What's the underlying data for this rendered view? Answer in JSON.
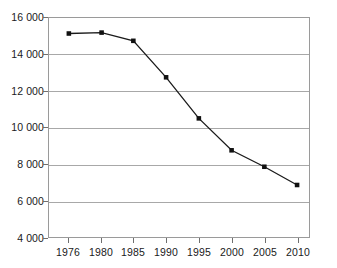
{
  "chart_data": {
    "type": "line",
    "title": "",
    "subtitle": "",
    "xlabel": "",
    "ylabel": "",
    "categories": [
      "1976",
      "1980",
      "1985",
      "1990",
      "1995",
      "2000",
      "2005",
      "2010"
    ],
    "values": [
      15150,
      15200,
      14750,
      12750,
      10500,
      8750,
      7850,
      6850
    ],
    "series": [
      {
        "name": "",
        "values": [
          15150,
          15200,
          14750,
          12750,
          10500,
          8750,
          7850,
          6850
        ]
      }
    ],
    "ylim": [
      4000,
      16000
    ],
    "ytick_labels": [
      "16 000",
      "14 000",
      "12 000",
      "10 000",
      "8 000",
      "6 000",
      "4 000"
    ],
    "ytick_values": [
      16000,
      14000,
      12000,
      10000,
      8000,
      6000,
      4000
    ],
    "grid": "horizontal",
    "legend": "none",
    "marker": "square",
    "line_color": "#1a1a1a",
    "marker_color": "#111111",
    "grid_color": "#a8a8a8",
    "frame_color": "#9a9a9a",
    "background": "#ffffff"
  }
}
